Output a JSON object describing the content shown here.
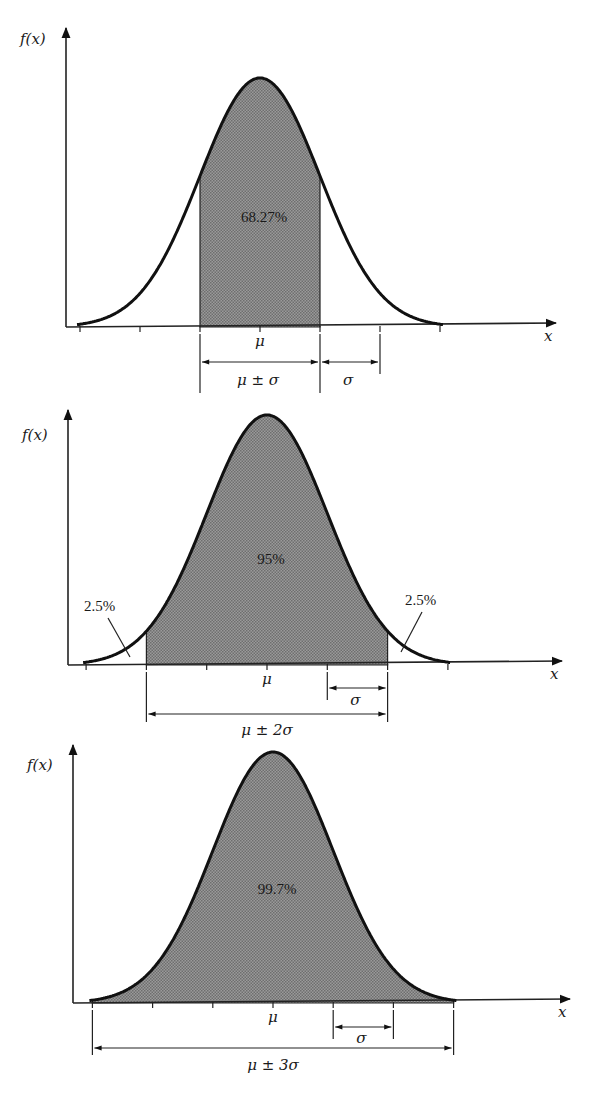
{
  "chart_data": [
    {
      "type": "area",
      "title": "",
      "ylabel": "f(x)",
      "xlabel": "x",
      "center_label": "μ",
      "shaded_region": "μ ± σ",
      "shaded_percent": "68.27%",
      "sigma_label": "σ",
      "range_label": "μ ± σ",
      "tick_positions_sigma": [
        -3,
        -2,
        -1,
        0,
        1,
        2,
        3
      ],
      "shade_from_sigma": -1,
      "shade_to_sigma": 1,
      "tail_labels": []
    },
    {
      "type": "area",
      "title": "",
      "ylabel": "f(x)",
      "xlabel": "x",
      "center_label": "μ",
      "shaded_region": "μ ± 2σ",
      "shaded_percent": "95%",
      "sigma_label": "σ",
      "range_label": "μ ± 2σ",
      "tick_positions_sigma": [
        -3,
        -2,
        -1,
        0,
        1,
        2,
        3
      ],
      "shade_from_sigma": -2,
      "shade_to_sigma": 2,
      "tail_labels": [
        "2.5%",
        "2.5%"
      ]
    },
    {
      "type": "area",
      "title": "",
      "ylabel": "f(x)",
      "xlabel": "x",
      "center_label": "μ",
      "shaded_region": "μ ± 3σ",
      "shaded_percent": "99.7%",
      "sigma_label": "σ",
      "range_label": "μ ± 3σ",
      "tick_positions_sigma": [
        -3,
        -2,
        -1,
        0,
        1,
        2,
        3
      ],
      "shade_from_sigma": -3,
      "shade_to_sigma": 3,
      "tail_labels": []
    }
  ],
  "colors": {
    "ink": "#111111",
    "shade": "#8c8c8c",
    "background": "#ffffff"
  }
}
